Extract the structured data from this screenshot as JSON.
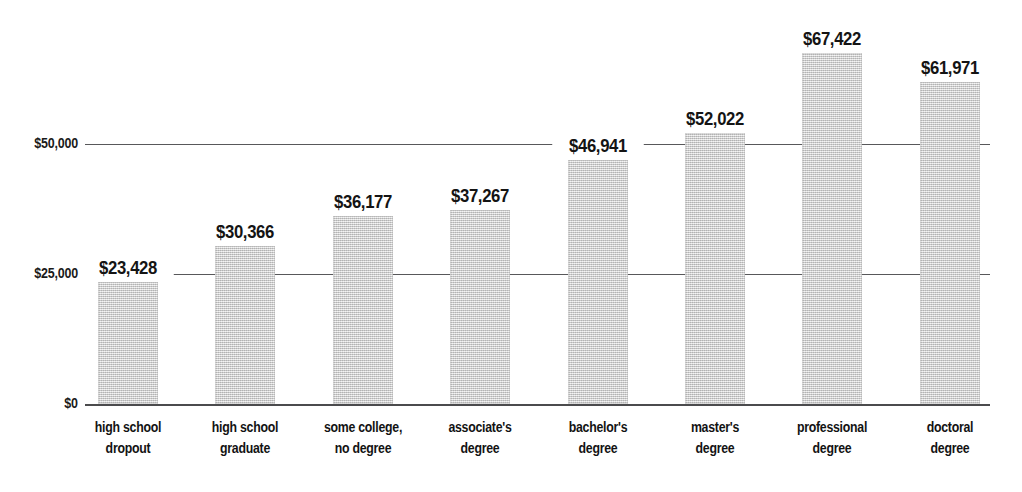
{
  "chart_data": {
    "type": "bar",
    "title": "",
    "subtitle": "",
    "xlabel": "",
    "ylabel": "",
    "categories": [
      "high school\ndropout",
      "high school\ngraduate",
      "some college,\nno degree",
      "associate's\ndegree",
      "bachelor's\ndegree",
      "master's\ndegree",
      "professional\ndegree",
      "doctoral\ndegree"
    ],
    "values": [
      23428,
      30366,
      36177,
      37267,
      46941,
      52022,
      67422,
      61971
    ],
    "value_labels": [
      "$23,428",
      "$30,366",
      "$36,177",
      "$37,267",
      "$46,941",
      "$52,022",
      "$67,422",
      "$61,971"
    ],
    "ylim": [
      0,
      73000
    ],
    "yticks": [
      0,
      25000,
      50000
    ],
    "ytick_labels": [
      "$0",
      "$25,000",
      "$50,000"
    ],
    "grid": true,
    "legend": false,
    "legend_position": "none",
    "series": [
      {
        "name": "median earnings",
        "values": [
          23428,
          30366,
          36177,
          37267,
          46941,
          52022,
          67422,
          61971
        ]
      }
    ],
    "colors": {
      "bar_fill": "#d2d2d2",
      "gridline": "#58585a",
      "axis": "#4b4b4d",
      "text": "#141414",
      "background": "#ffffff"
    }
  },
  "geometry": {
    "plot_left": 85,
    "plot_right": 990,
    "baseline_y": 404,
    "gridline_25000_y": 274,
    "gridline_50000_y": 151,
    "bar_width": 60,
    "bar_step": 117.4,
    "first_bar_x": 98
  }
}
